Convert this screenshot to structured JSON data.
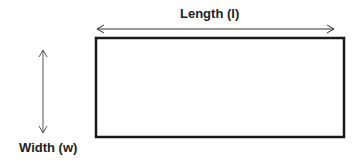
{
  "diagram": {
    "labels": {
      "length": "Length (l)",
      "width": "Width (w)"
    },
    "shapes": {
      "rectangle": {
        "x": 96,
        "y": 38,
        "width": 248,
        "height": 99,
        "stroke": "#1a1a1a",
        "stroke_width": 2.5
      },
      "length_arrow": {
        "x1": 97,
        "y1": 29,
        "x2": 334,
        "y2": 29,
        "stroke": "#333333"
      },
      "width_arrow": {
        "x1": 43,
        "y1": 50,
        "x2": 43,
        "y2": 133,
        "stroke": "#555555"
      }
    }
  }
}
